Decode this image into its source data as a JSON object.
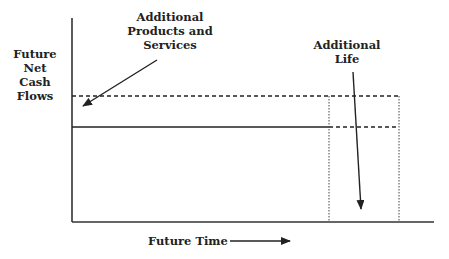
{
  "diagram": {
    "y_axis_label": [
      "Future",
      "Net",
      "Cash",
      "Flows"
    ],
    "x_axis_label": "Future Time",
    "annotations": {
      "products": [
        "Additional",
        "Products and",
        "Services"
      ],
      "life": [
        "Additional",
        "Life"
      ]
    },
    "elements": {
      "baseline_cash_flow": "solid horizontal line",
      "increased_cash_flow": "dashed horizontal line",
      "extended_life_region": "dotted vertical boundaries"
    },
    "colors": {
      "ink": "#222222",
      "background": "#ffffff"
    }
  }
}
